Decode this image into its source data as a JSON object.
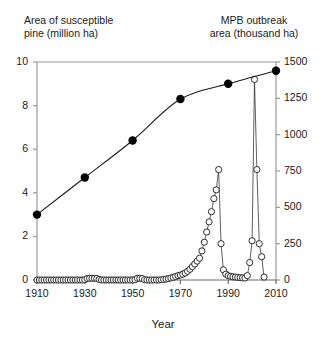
{
  "header": {
    "left_title": "Area of susceptible\npine (million ha)",
    "right_title": "MPB outbreak\narea (thousand ha)"
  },
  "axis": {
    "x_title": "Year",
    "x_ticks": [
      "1910",
      "1930",
      "1950",
      "1970",
      "1990",
      "2010"
    ],
    "y_left_ticks": [
      "0",
      "2",
      "4",
      "6",
      "8",
      "10"
    ],
    "y_right_ticks": [
      "0",
      "250",
      "500",
      "750",
      "1000",
      "1250",
      "1500"
    ]
  },
  "colors": {
    "axis": "#808080",
    "line": "#1a1a1a",
    "filled_marker": "#000000",
    "open_marker_fill": "#ffffff",
    "text": "#1a1a1a"
  },
  "chart_data": {
    "type": "line",
    "title": "",
    "xlabel": "Year",
    "xlim": [
      1910,
      2010
    ],
    "grid": false,
    "legend": "none",
    "series": [
      {
        "name": "Area of susceptible pine (million ha)",
        "marker": "filled-circle",
        "axis": "left",
        "ylabel": "Area of susceptible pine (million ha)",
        "ylim": [
          0,
          10
        ],
        "x": [
          1910,
          1930,
          1950,
          1970,
          1990,
          2010
        ],
        "values": [
          3.0,
          4.7,
          6.4,
          8.3,
          9.0,
          9.6
        ]
      },
      {
        "name": "MPB outbreak area (thousand ha)",
        "marker": "open-circle",
        "axis": "right",
        "ylabel": "MPB outbreak area (thousand ha)",
        "ylim": [
          0,
          1500
        ],
        "x": [
          1910,
          1911,
          1912,
          1913,
          1914,
          1915,
          1916,
          1917,
          1918,
          1919,
          1920,
          1921,
          1922,
          1923,
          1924,
          1925,
          1926,
          1927,
          1928,
          1929,
          1930,
          1931,
          1932,
          1933,
          1934,
          1935,
          1936,
          1937,
          1938,
          1939,
          1940,
          1941,
          1942,
          1943,
          1944,
          1945,
          1946,
          1947,
          1948,
          1949,
          1950,
          1951,
          1952,
          1953,
          1954,
          1955,
          1956,
          1957,
          1958,
          1959,
          1960,
          1961,
          1962,
          1963,
          1964,
          1965,
          1966,
          1967,
          1968,
          1969,
          1970,
          1971,
          1972,
          1973,
          1974,
          1975,
          1976,
          1977,
          1978,
          1979,
          1980,
          1981,
          1982,
          1983,
          1984,
          1985,
          1986,
          1987,
          1988,
          1989,
          1990,
          1991,
          1992,
          1993,
          1994,
          1995,
          1996,
          1997,
          1998,
          1999,
          2000,
          2001,
          2002,
          2003,
          2004,
          2005
        ],
        "values": [
          0,
          0,
          0,
          0,
          0,
          0,
          0,
          0,
          0,
          0,
          0,
          0,
          0,
          0,
          0,
          0,
          0,
          0,
          0,
          0,
          2,
          10,
          12,
          12,
          12,
          10,
          4,
          0,
          0,
          0,
          0,
          0,
          0,
          0,
          0,
          0,
          0,
          0,
          0,
          0,
          0,
          2,
          12,
          12,
          10,
          2,
          0,
          0,
          0,
          0,
          0,
          0,
          2,
          4,
          6,
          10,
          14,
          18,
          24,
          30,
          34,
          40,
          48,
          60,
          74,
          92,
          110,
          130,
          150,
          200,
          260,
          330,
          400,
          470,
          560,
          620,
          760,
          250,
          70,
          40,
          30,
          25,
          22,
          20,
          18,
          16,
          15,
          14,
          30,
          120,
          270,
          1380,
          760,
          250,
          160,
          20
        ]
      }
    ]
  }
}
